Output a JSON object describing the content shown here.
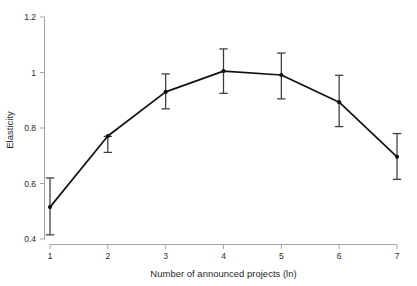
{
  "chart_data": {
    "type": "line",
    "title": "",
    "subtitle": "",
    "xlabel": "Number of announced projects (ln)",
    "ylabel": "Elasticity",
    "x": [
      1,
      2,
      3,
      4,
      5,
      6,
      7
    ],
    "values": [
      0.515,
      0.771,
      0.93,
      1.005,
      0.991,
      0.893,
      0.696
    ],
    "error_low": [
      0.415,
      0.712,
      0.869,
      0.925,
      0.905,
      0.805,
      0.615
    ],
    "error_high": [
      0.62,
      0.77,
      0.995,
      1.085,
      1.07,
      0.99,
      0.78
    ],
    "series": [
      {
        "name": "Elasticity",
        "values": [
          0.515,
          0.771,
          0.93,
          1.005,
          0.991,
          0.893,
          0.696
        ]
      }
    ],
    "xlim": [
      1,
      7
    ],
    "ylim": [
      0.4,
      1.2
    ],
    "xticks": [
      1,
      2,
      3,
      4,
      5,
      6,
      7
    ],
    "yticks": [
      0.4,
      0.6,
      0.8,
      1.0,
      1.2
    ],
    "xtick_labels": [
      "1",
      "2",
      "3",
      "4",
      "5",
      "6",
      "7"
    ],
    "ytick_labels": [
      "0.4",
      "0.6",
      "0.8",
      "1",
      "1.2"
    ],
    "grid": false,
    "legend": "none",
    "error_bars": "vertical-capped",
    "marker": "circle",
    "line_color": "#111111",
    "error_color": "#3a3a3a",
    "axis_color": "#9a9a9a",
    "background_color": "#ffffff"
  },
  "axes": {
    "y_title": "Elasticity",
    "x_title": "Number of announced projects (ln)"
  },
  "ytick_0": "0.4",
  "ytick_1": "0.6",
  "ytick_2": "0.8",
  "ytick_3": "1",
  "ytick_4": "1.2",
  "xtick_0": "1",
  "xtick_1": "2",
  "xtick_2": "3",
  "xtick_3": "4",
  "xtick_4": "5",
  "xtick_5": "6",
  "xtick_6": "7"
}
